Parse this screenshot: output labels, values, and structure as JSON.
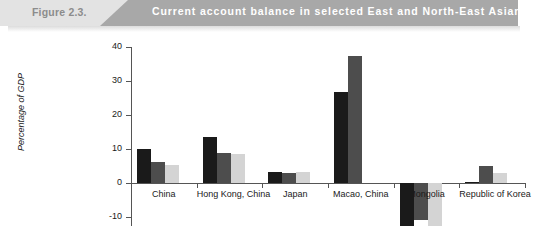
{
  "header": {
    "figure_number": "Figure 2.3.",
    "title": "Current account balance in selected East and North-East Asian economies, 2008-2010"
  },
  "chart_data": {
    "type": "bar",
    "title": "Current account balance in selected East and North-East Asian economies, 2008-2010",
    "xlabel": "",
    "ylabel": "Percentage of GDP",
    "ylim": [
      -10,
      40
    ],
    "yticks": [
      -10,
      0,
      10,
      20,
      30,
      40
    ],
    "grid": false,
    "legend": "none",
    "categories": [
      "China",
      "Hong Kong, China",
      "Japan",
      "Macao, China",
      "Mongolia",
      "Republic of Korea"
    ],
    "series": [
      {
        "name": "2008",
        "color": "#1a1a1a",
        "values": [
          9.9,
          13.6,
          3.3,
          26.8,
          -12.6,
          0.3
        ]
      },
      {
        "name": "2009",
        "color": "#4d4d4d",
        "values": [
          6.1,
          8.8,
          2.8,
          37.4,
          -10.9,
          5.1
        ]
      },
      {
        "name": "2010",
        "color": "#d4d4d4",
        "values": [
          5.4,
          8.5,
          3.3,
          0,
          -13.5,
          2.8
        ]
      }
    ]
  }
}
